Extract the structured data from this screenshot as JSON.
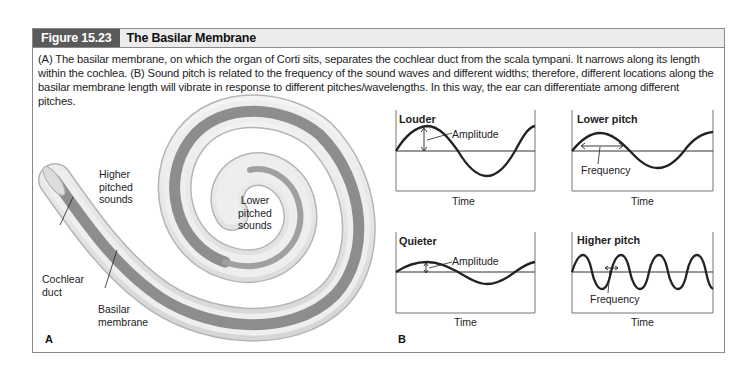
{
  "figure": {
    "label": "Figure 15.23",
    "title": "The Basilar Membrane",
    "caption": "(A) The basilar membrane, on which the organ of Corti sits, separates the cochlear duct from the scala tympani. It narrows along its length within the cochlea. (B) Sound pitch is related to the frequency of the sound waves and different widths; therefore, different locations along the basilar membrane length will vibrate in response to different pitches/wavelengths. In this way, the ear can differentiate among different pitches."
  },
  "panel_a": {
    "letter": "A",
    "labels": {
      "higher_1": "Higher",
      "higher_2": "pitched",
      "higher_3": "sounds",
      "lower_1": "Lower",
      "lower_2": "pitched",
      "lower_3": "sounds",
      "duct_1": "Cochlear",
      "duct_2": "duct",
      "basilar_1": "Basilar",
      "basilar_2": "membrane"
    },
    "colors": {
      "tube": "#e2e2e2",
      "membrane": "#8d8d8d",
      "outline": "#b9b9b9"
    }
  },
  "panel_b": {
    "letter": "B",
    "plots": [
      {
        "title": "Louder",
        "annotation": "Amplitude",
        "xlabel": "Time",
        "amplitude": "large",
        "cycles": 1.25
      },
      {
        "title": "Lower pitch",
        "annotation": "Frequency",
        "xlabel": "Time",
        "amplitude": "medium",
        "cycles": 1.25
      },
      {
        "title": "Quieter",
        "annotation": "Amplitude",
        "xlabel": "Time",
        "amplitude": "small",
        "cycles": 1.25
      },
      {
        "title": "Higher pitch",
        "annotation": "Frequency",
        "xlabel": "Time",
        "amplitude": "medium",
        "cycles": 4.75
      }
    ]
  }
}
